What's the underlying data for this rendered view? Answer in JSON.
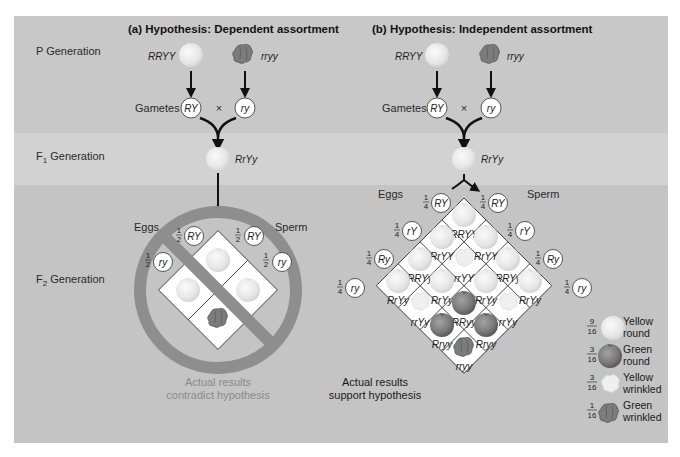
{
  "rows": {
    "p": "P Generation",
    "f1_prefix": "F",
    "f1_sub": "1",
    "f1_suffix": " Generation",
    "f2_prefix": "F",
    "f2_sub": "2",
    "f2_suffix": " Generation"
  },
  "panel_a": {
    "title": "(a) Hypothesis: Dependent assortment",
    "parent1": "RRYY",
    "parent2": "rryy",
    "gametes_label": "Gametes",
    "gamete1": "RY",
    "cross": "×",
    "gamete2": "ry",
    "f1": "RrYy",
    "eggs": "Eggs",
    "sperm": "Sperm",
    "egg_gametes": [
      {
        "frac_n": "1",
        "frac_d": "2",
        "allele": "RY"
      },
      {
        "frac_n": "1",
        "frac_d": "2",
        "allele": "ry"
      }
    ],
    "sperm_gametes": [
      {
        "frac_n": "1",
        "frac_d": "2",
        "allele": "RY"
      },
      {
        "frac_n": "1",
        "frac_d": "2",
        "allele": "ry"
      }
    ],
    "result_line1": "Actual results",
    "result_line2": "contradict hypothesis"
  },
  "panel_b": {
    "title": "(b) Hypothesis: Independent assortment",
    "parent1": "RRYY",
    "parent2": "rryy",
    "gametes_label": "Gametes",
    "gamete1": "RY",
    "cross": "×",
    "gamete2": "ry",
    "f1": "RrYy",
    "eggs": "Eggs",
    "sperm": "Sperm",
    "egg_gametes": [
      {
        "frac_n": "1",
        "frac_d": "4",
        "allele": "RY"
      },
      {
        "frac_n": "1",
        "frac_d": "4",
        "allele": "rY"
      },
      {
        "frac_n": "1",
        "frac_d": "4",
        "allele": "Ry"
      },
      {
        "frac_n": "1",
        "frac_d": "4",
        "allele": "ry"
      }
    ],
    "sperm_gametes": [
      {
        "frac_n": "1",
        "frac_d": "4",
        "allele": "RY"
      },
      {
        "frac_n": "1",
        "frac_d": "4",
        "allele": "rY"
      },
      {
        "frac_n": "1",
        "frac_d": "4",
        "allele": "Ry"
      },
      {
        "frac_n": "1",
        "frac_d": "4",
        "allele": "ry"
      }
    ],
    "grid": [
      [
        "RRYY",
        "RrYY",
        "RRYy",
        "RrYy"
      ],
      [
        "RrYY",
        "rrYY",
        "RrYy",
        "rrYy"
      ],
      [
        "RRYy",
        "RrYy",
        "RRyy",
        "Rryy"
      ],
      [
        "RrYy",
        "rrYy",
        "Rryy",
        "rryy"
      ]
    ],
    "result_line1": "Actual results",
    "result_line2": "support hypothesis"
  },
  "legend": [
    {
      "frac_n": "9",
      "frac_d": "16",
      "line1": "Yellow",
      "line2": "round",
      "phenotype": "yellow-round"
    },
    {
      "frac_n": "3",
      "frac_d": "16",
      "line1": "Green",
      "line2": "round",
      "phenotype": "green-round"
    },
    {
      "frac_n": "3",
      "frac_d": "16",
      "line1": "Yellow",
      "line2": "wrinkled",
      "phenotype": "yellow-wrinkled"
    },
    {
      "frac_n": "1",
      "frac_d": "16",
      "line1": "Green",
      "line2": "wrinkled",
      "phenotype": "green-wrinkled"
    }
  ],
  "colors": {
    "panel_bg": "#c9c9c9",
    "f1_band": "#d3d3d3",
    "no_sign": "#8c8c8c",
    "pea_yellow": "#ececec",
    "pea_green": "#7d7d7d"
  }
}
